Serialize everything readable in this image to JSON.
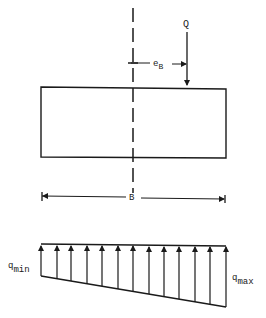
{
  "diagram": {
    "load": {
      "label": "Q"
    },
    "eccentricity": {
      "label": "e",
      "subscript": "B"
    },
    "width": {
      "label": "B"
    },
    "pressure": {
      "min": {
        "label": "q",
        "subscript": "min"
      },
      "max": {
        "label": "q",
        "subscript": "max"
      },
      "arrow_count": 13
    },
    "colors": {
      "line": "#1a1a1a",
      "background": "#ffffff"
    }
  }
}
